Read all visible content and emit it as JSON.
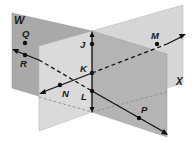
{
  "diagram": {
    "type": "intersecting-planes",
    "planes": [
      {
        "id": "W",
        "label": "W"
      },
      {
        "id": "X",
        "label": "X"
      }
    ],
    "points": [
      {
        "id": "J",
        "label": "J",
        "x": 92,
        "y": 44
      },
      {
        "id": "K",
        "label": "K",
        "x": 92,
        "y": 73
      },
      {
        "id": "L",
        "label": "L",
        "x": 92,
        "y": 91
      },
      {
        "id": "M",
        "label": "M",
        "x": 157,
        "y": 44
      },
      {
        "id": "N",
        "label": "N",
        "x": 60,
        "y": 85
      },
      {
        "id": "P",
        "label": "P",
        "x": 139,
        "y": 118
      },
      {
        "id": "Q",
        "label": "Q",
        "x": 25,
        "y": 43
      },
      {
        "id": "R",
        "label": "R",
        "x": 25,
        "y": 56
      }
    ],
    "colors": {
      "plane_w_left": "#a9a9a9",
      "plane_back_right": "#d4d4d4",
      "plane_front_left": "#d8d8d8",
      "plane_front_right": "#b3b3b3",
      "line": "#111111"
    }
  }
}
